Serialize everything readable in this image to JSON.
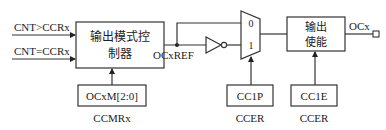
{
  "inputs": {
    "cnt_gt": "CNT>CCRx",
    "cnt_eq": "CNT=CCRx"
  },
  "mode_controller": {
    "line1": "输出模式控",
    "line2": "制器"
  },
  "ocxref_label": "OCxREF",
  "mux": {
    "input0": "0",
    "input1": "1"
  },
  "enable_block": {
    "line1": "输出",
    "line2": "使能"
  },
  "output_label": "OCx",
  "control_boxes": [
    {
      "field": "OCxM[2:0]",
      "register": "CCMRx"
    },
    {
      "field": "CC1P",
      "register": "CCER"
    },
    {
      "field": "CC1E",
      "register": "CCER"
    }
  ],
  "colors": {
    "stroke": "#333333",
    "text": "#222222",
    "background": "#ffffff"
  }
}
